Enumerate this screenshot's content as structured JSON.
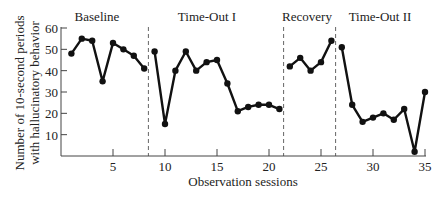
{
  "chart_data": {
    "type": "line",
    "title": "",
    "xlabel": "Observation sessions",
    "ylabel_lines": [
      "Number of 10-second periods",
      "with hallucinatory behavior"
    ],
    "ylabel": "Number of 10-second periods with hallucinatory behavior",
    "xlim": [
      0,
      35
    ],
    "ylim": [
      0,
      60
    ],
    "x_ticks": [
      5,
      10,
      15,
      20,
      25,
      30,
      35
    ],
    "y_ticks": [
      10,
      20,
      30,
      40,
      50,
      60
    ],
    "grid": false,
    "legend": null,
    "phases": [
      {
        "label": "Baseline",
        "sessions": [
          1,
          8
        ]
      },
      {
        "label": "Time-Out I",
        "sessions": [
          9,
          21
        ]
      },
      {
        "label": "Recovery",
        "sessions": [
          22,
          26
        ]
      },
      {
        "label": "Time-Out II",
        "sessions": [
          27,
          35
        ]
      }
    ],
    "phase_dividers": [
      8.5,
      21.5,
      26.5
    ],
    "series": [
      {
        "name": "Baseline",
        "x": [
          1,
          2,
          3,
          4,
          5,
          6,
          7,
          8
        ],
        "values": [
          48,
          55,
          54,
          35,
          53,
          50,
          47,
          41
        ]
      },
      {
        "name": "Time-Out I",
        "x": [
          9,
          10,
          11,
          12,
          13,
          14,
          15,
          16,
          17,
          18,
          19,
          20,
          21
        ],
        "values": [
          49,
          15,
          40,
          49,
          40,
          44,
          45,
          34,
          21,
          23,
          24,
          24,
          22
        ]
      },
      {
        "name": "Recovery",
        "x": [
          22,
          23,
          24,
          25,
          26
        ],
        "values": [
          42,
          46,
          40,
          44,
          54
        ]
      },
      {
        "name": "Time-Out II",
        "x": [
          27,
          28,
          29,
          30,
          31,
          32,
          33,
          34,
          35
        ],
        "values": [
          51,
          24,
          16,
          18,
          20,
          17,
          22,
          2,
          30
        ]
      }
    ],
    "colors": {
      "line": "#111111",
      "axis": "#444444",
      "divider": "#666666"
    }
  }
}
